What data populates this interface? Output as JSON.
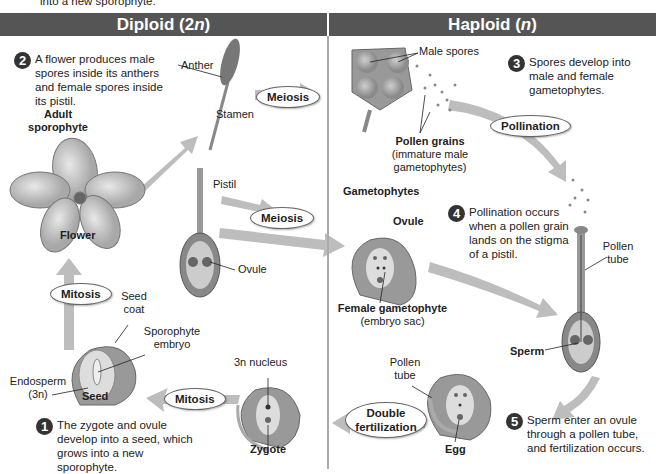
{
  "top_clip_text": "into a new sporophyte.",
  "headers": {
    "diploid": {
      "label": "Diploid (2",
      "italic": "n",
      "close": ")"
    },
    "haploid": {
      "label": "Haploid (",
      "italic": "n",
      "close": ")"
    }
  },
  "steps": [
    {
      "number": "1",
      "text": "The zygote and ovule develop into a seed, which grows into a new sporophyte."
    },
    {
      "number": "2",
      "text": "A flower produces male spores inside its anthers and female spores inside its pistil."
    },
    {
      "number": "3",
      "text": "Spores develop into male and female gametophytes."
    },
    {
      "number": "4",
      "text": "Pollination occurs when a pollen grain lands on the stigma of a pistil."
    },
    {
      "number": "5",
      "text": "Sperm enter an ovule through a pollen tube, and fertilization occurs."
    }
  ],
  "processes": {
    "meiosis_top": "Meiosis",
    "meiosis_mid": "Meiosis",
    "pollination": "Pollination",
    "double_fertilization": "Double fertilization",
    "mitosis_bottom": "Mitosis",
    "mitosis_left": "Mitosis"
  },
  "labels": {
    "adult_sporophyte": "Adult sporophyte",
    "flower": "Flower",
    "anther": "Anther",
    "stamen": "Stamen",
    "pistil": "Pistil",
    "ovule_left": "Ovule",
    "male_spores": "Male spores",
    "pollen_grains": "Pollen grains",
    "pollen_grains_sub": "(immature male gametophytes)",
    "gametophytes": "Gametophytes",
    "ovule_right": "Ovule",
    "female_gametophyte": "Female gametophyte",
    "female_gametophyte_sub": "(embryo sac)",
    "pollen_tube_right": "Pollen tube",
    "sperm": "Sperm",
    "pollen_tube_bottom": "Pollen tube",
    "egg": "Egg",
    "seed_coat": "Seed coat",
    "sporophyte_embryo": "Sporophyte embryo",
    "endosperm": "Endosperm",
    "endosperm_sub": "(3n)",
    "seed": "Seed",
    "nucleus_3n": "3n nucleus",
    "zygote": "Zygote"
  },
  "colors": {
    "header_bg": "#555555",
    "arrow": "#b8b8b8",
    "tissue": "#9a9a9a",
    "dark": "#333333"
  }
}
